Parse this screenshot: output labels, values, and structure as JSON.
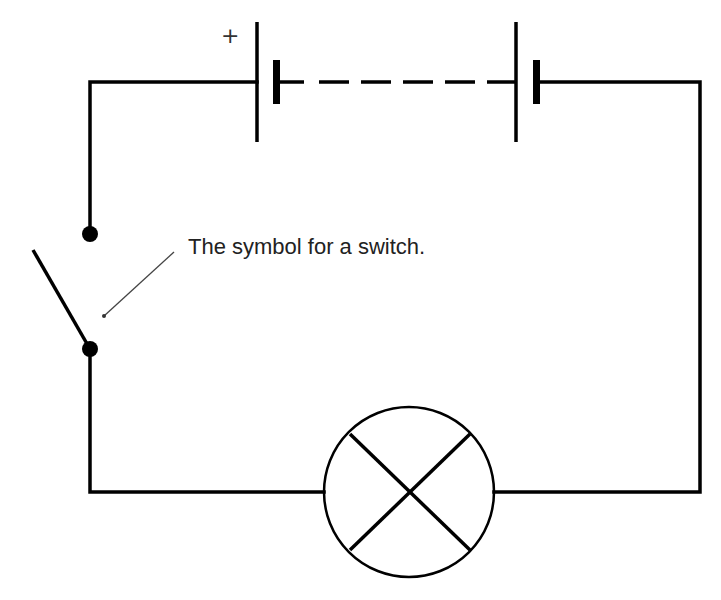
{
  "diagram": {
    "annotation": "The symbol for a switch.",
    "battery_polarity_label": "+",
    "components": [
      {
        "type": "cell",
        "name": "cell-1",
        "position": "top-left"
      },
      {
        "type": "cell",
        "name": "cell-2",
        "position": "top-right"
      },
      {
        "type": "switch",
        "state": "open",
        "position": "left"
      },
      {
        "type": "lamp",
        "position": "bottom"
      }
    ],
    "colors": {
      "wire": "#000000",
      "background": "#ffffff",
      "text": "#222222",
      "leader_line": "#444444"
    }
  }
}
